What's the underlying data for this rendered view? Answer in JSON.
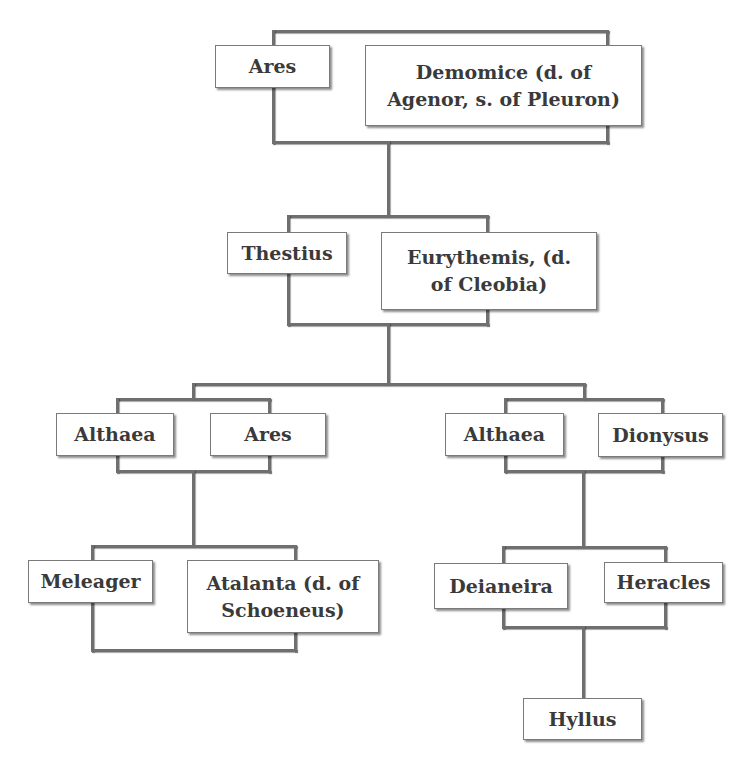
{
  "diagram": {
    "type": "family-tree",
    "generations": [
      {
        "couple": [
          "Ares",
          "Demomice (d. of Agenor, s. of Pleuron)"
        ]
      },
      {
        "couple": [
          "Thestius",
          "Eurythemis, (d. of Cleobia)"
        ]
      },
      {
        "couples": [
          [
            "Althaea",
            "Ares"
          ],
          [
            "Althaea",
            "Dionysus"
          ]
        ]
      },
      {
        "couples": [
          [
            "Meleager",
            "Atalanta (d. of Schoeneus)"
          ],
          [
            "Deianeira",
            "Heracles"
          ]
        ]
      },
      {
        "child": "Hyllus"
      }
    ]
  },
  "nodes": {
    "ares_1": "Ares",
    "demomice": "Demomice (d. of\nAgenor, s. of Pleuron)",
    "thestius": "Thestius",
    "eurythemis": "Eurythemis, (d.\nof Cleobia)",
    "althaea_1": "Althaea",
    "ares_2": "Ares",
    "althaea_2": "Althaea",
    "dionysus": "Dionysus",
    "meleager": "Meleager",
    "atalanta": "Atalanta (d. of\nSchoeneus)",
    "deianeira": "Deianeira",
    "heracles": "Heracles",
    "hyllus": "Hyllus"
  },
  "edges": [
    {
      "from": "ares_1+demomice",
      "to": "thestius"
    },
    {
      "from": "thestius+eurythemis",
      "to": "althaea_1"
    },
    {
      "from": "thestius+eurythemis",
      "to": "althaea_2"
    },
    {
      "from": "althaea_1+ares_2",
      "to": "meleager"
    },
    {
      "from": "althaea_2+dionysus",
      "to": "deianeira"
    },
    {
      "from": "deianeira+heracles",
      "to": "hyllus"
    }
  ],
  "colors": {
    "line": "#6f6f6f",
    "box_border": "#7a7a7a",
    "text": "#3a3a3a",
    "background": "#ffffff"
  }
}
